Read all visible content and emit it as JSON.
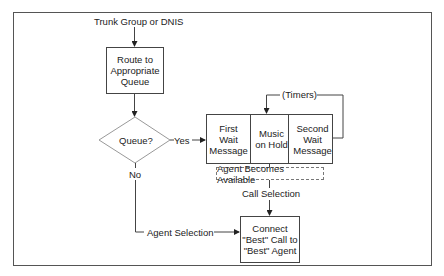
{
  "diagram": {
    "type": "flowchart",
    "nodes": {
      "start_label": "Trunk Group or DNIS",
      "route_box": "Route to\nAppropriate\nQueue",
      "decision": "Queue?",
      "yes_label": "Yes",
      "no_label": "No",
      "first_wait": "First\nWait\nMessage",
      "music_on_hold": "Music\non Hold",
      "second_wait": "Second\nWait\nMessage",
      "timers_label": "(Timers)",
      "agent_available": "Agent Becomes Available",
      "call_selection": "Call Selection",
      "agent_selection": "Agent Selection",
      "connect_box": "Connect\n\"Best\" Call to\n\"Best\" Agent"
    },
    "colors": {
      "line": "#444444",
      "background": "#ffffff",
      "frame": "#555555"
    }
  }
}
